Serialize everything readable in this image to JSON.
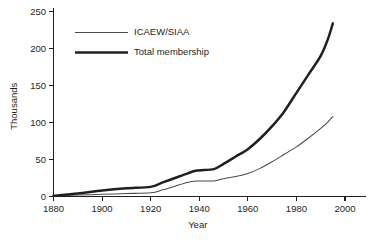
{
  "chart_data": {
    "type": "line",
    "title": "",
    "xlabel": "Year",
    "ylabel": "Thousands",
    "xlim": [
      1876,
      2006
    ],
    "ylim": [
      0,
      262
    ],
    "grid": false,
    "legend_position": "upper-left-inside",
    "xticks": [
      1880,
      1900,
      1920,
      1940,
      1960,
      1980,
      2000
    ],
    "xtick_labels": [
      "1880",
      "1900",
      "1920",
      "1940",
      "1960",
      "1980",
      "2000"
    ],
    "yticks": [
      0,
      50,
      100,
      150,
      200,
      250
    ],
    "ytick_labels": [
      "0",
      "50",
      "100",
      "150",
      "200",
      "250"
    ],
    "series": [
      {
        "name": "ICAEW/SIAA",
        "style": "thin",
        "color": "#4c4a4b",
        "x": [
          1880,
          1890,
          1900,
          1910,
          1920,
          1925,
          1930,
          1935,
          1939,
          1946,
          1950,
          1955,
          1960,
          1965,
          1970,
          1975,
          1980,
          1985,
          1990,
          1993,
          1995
        ],
        "y": [
          1,
          2,
          3,
          4,
          5,
          9,
          14,
          19,
          21,
          21,
          24,
          27,
          31,
          38,
          47,
          57,
          67,
          79,
          92,
          101,
          108
        ]
      },
      {
        "name": "Total membership",
        "style": "thick",
        "color": "#231f20",
        "x": [
          1880,
          1890,
          1900,
          1910,
          1920,
          1925,
          1930,
          1935,
          1939,
          1946,
          1950,
          1955,
          1960,
          1965,
          1970,
          1975,
          1980,
          1985,
          1990,
          1993,
          1995
        ],
        "y": [
          1,
          4,
          8,
          11,
          13,
          19,
          25,
          31,
          35,
          37,
          44,
          54,
          64,
          78,
          95,
          115,
          140,
          165,
          190,
          213,
          234
        ]
      }
    ]
  },
  "legend": {
    "items": [
      {
        "label": "ICAEW/SIAA",
        "style": "thin"
      },
      {
        "label": "Total membership",
        "style": "thick"
      }
    ]
  },
  "axes": {
    "y_title": "Thousands",
    "x_title": "Year"
  }
}
